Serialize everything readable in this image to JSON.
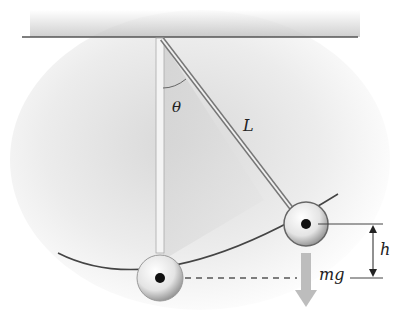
{
  "diagram": {
    "labels": {
      "angle": "θ",
      "length": "L",
      "height": "h",
      "weight": "mg"
    },
    "colors": {
      "line": "#444444",
      "arrow": "#b5b5b5",
      "bob_center": "#111111",
      "shadow": "#d0d0d0"
    }
  }
}
